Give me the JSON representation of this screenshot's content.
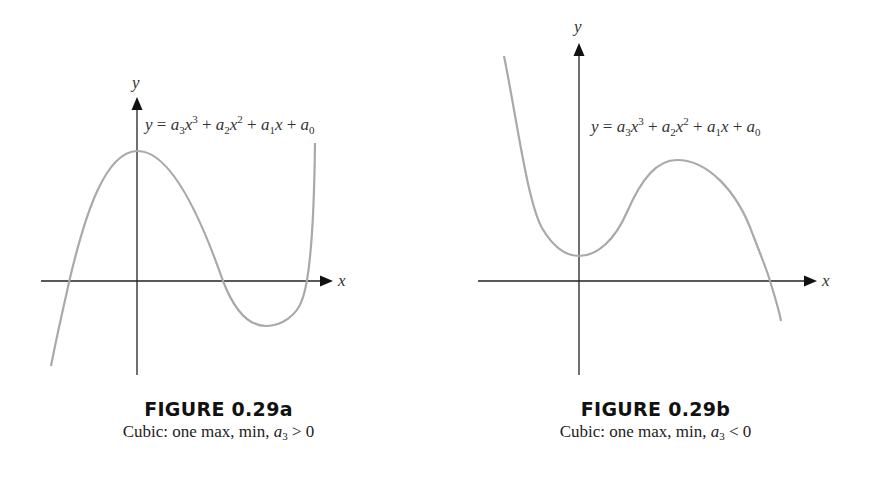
{
  "figures": [
    {
      "id": "a",
      "title": "FIGURE 0.29a",
      "caption_prefix": "Cubic: one max, min, ",
      "caption_var": "a",
      "caption_sub": "3",
      "caption_relation": " > 0",
      "x_axis_label": "x",
      "y_axis_label": "y",
      "equation": {
        "lhs": "y",
        "eq": " = ",
        "terms": [
          {
            "coef": "a",
            "sub": "3",
            "var": "x",
            "pow": "3"
          },
          {
            "op": " + ",
            "coef": "a",
            "sub": "2",
            "var": "x",
            "pow": "2"
          },
          {
            "op": " + ",
            "coef": "a",
            "sub": "1",
            "var": "x",
            "pow": ""
          },
          {
            "op": " + ",
            "coef": "a",
            "sub": "0",
            "var": "",
            "pow": ""
          }
        ]
      }
    },
    {
      "id": "b",
      "title": "FIGURE 0.29b",
      "caption_prefix": "Cubic: one max, min, ",
      "caption_var": "a",
      "caption_sub": "3",
      "caption_relation": " < 0",
      "x_axis_label": "x",
      "y_axis_label": "y",
      "equation": {
        "lhs": "y",
        "eq": " = ",
        "terms": [
          {
            "coef": "a",
            "sub": "3",
            "var": "x",
            "pow": "3"
          },
          {
            "op": " + ",
            "coef": "a",
            "sub": "2",
            "var": "x",
            "pow": "2"
          },
          {
            "op": " + ",
            "coef": "a",
            "sub": "1",
            "var": "x",
            "pow": ""
          },
          {
            "op": " + ",
            "coef": "a",
            "sub": "0",
            "var": "",
            "pow": ""
          }
        ]
      }
    }
  ],
  "colors": {
    "axis": "#222222",
    "curve": "#a9a9a9",
    "text": "#333333"
  }
}
